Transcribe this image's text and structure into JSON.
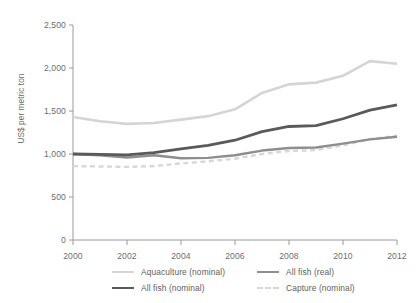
{
  "chart_data": {
    "type": "line",
    "title": "",
    "xlabel": "",
    "ylabel": "US$ per metric ton",
    "xlim": [
      2000,
      2012
    ],
    "ylim": [
      0,
      2500
    ],
    "grid": false,
    "legend_position": "bottom",
    "x": [
      2000,
      2001,
      2002,
      2003,
      2004,
      2005,
      2006,
      2007,
      2008,
      2009,
      2010,
      2011,
      2012
    ],
    "xticks": [
      "2000",
      "2002",
      "2004",
      "2006",
      "2008",
      "2010",
      "2012"
    ],
    "yticks": [
      "0",
      "500",
      "1,000",
      "1,500",
      "2,000",
      "2,500"
    ],
    "series": [
      {
        "name": "Aquaculture (nominal)",
        "color": "#d5d5d5",
        "style": "solid",
        "width": 2.6,
        "values": [
          1430,
          1380,
          1350,
          1360,
          1400,
          1440,
          1520,
          1710,
          1810,
          1830,
          1910,
          2080,
          2050
        ]
      },
      {
        "name": "All fish (nominal)",
        "color": "#5a5a5a",
        "style": "solid",
        "width": 2.8,
        "values": [
          1000,
          995,
          990,
          1015,
          1060,
          1100,
          1160,
          1260,
          1320,
          1330,
          1410,
          1510,
          1570
        ]
      },
      {
        "name": "All fish (real)",
        "color": "#8e8e8e",
        "style": "solid",
        "width": 2.4,
        "values": [
          1000,
          985,
          960,
          985,
          950,
          955,
          985,
          1040,
          1070,
          1075,
          1120,
          1170,
          1200
        ]
      },
      {
        "name": "Capture (nominal)",
        "color": "#d8d8d8",
        "style": "dashed",
        "width": 2.4,
        "values": [
          860,
          855,
          850,
          860,
          890,
          915,
          945,
          1000,
          1035,
          1045,
          1100,
          1175,
          1210
        ]
      }
    ]
  },
  "legend": {
    "items": [
      {
        "label": "Aquaculture (nominal)"
      },
      {
        "label": "All fish (real)"
      },
      {
        "label": "All fish (nominal)"
      },
      {
        "label": "Capture (nominal)"
      }
    ]
  },
  "axis": {
    "color": "#9a9a9a"
  }
}
